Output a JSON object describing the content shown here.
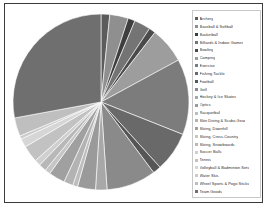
{
  "chart_data": {
    "type": "pie",
    "title": "",
    "legend_position": "right",
    "start_angle_deg": 0,
    "direction": "clockwise",
    "categories": [
      "Archery",
      "Baseball & Softball",
      "Basketball",
      "Billiards & Indoor Games",
      "Bowling",
      "Camping",
      "Exercise",
      "Fishing Tackle",
      "Football",
      "Golf",
      "Hockey & Ice Skates",
      "Optics",
      "Racquetball",
      "Skin Diving & Scuba Gear",
      "Skiing, Downhill",
      "Skiing, Cross-Country",
      "Skiing, Snowboards",
      "Soccer Balls",
      "Tennis",
      "Volleyball & Badminton Sets",
      "Water Skis",
      "Wheel Sports & Pogo Sticks",
      "Team Goods"
    ],
    "values": [
      1.6,
      3.4,
      1.3,
      3.0,
      1.2,
      6.6,
      13.9,
      7.3,
      1.5,
      9.1,
      2.1,
      3.3,
      0.9,
      1.7,
      3.0,
      1.0,
      1.4,
      1.1,
      3.1,
      1.6,
      0.6,
      3.4,
      27.9
    ],
    "colors": [
      "#5c5c5c",
      "#8f8f8f",
      "#3e3e3e",
      "#747474",
      "#4a4a4a",
      "#9d9d9d",
      "#7c7c7c",
      "#696969",
      "#565656",
      "#8a8a8a",
      "#a8a8a8",
      "#9a9a9a",
      "#bdbdbd",
      "#b3b3b3",
      "#a0a0a0",
      "#c6c6c6",
      "#b8b8b8",
      "#cfcfcf",
      "#c2c2c2",
      "#d6d6d6",
      "#cbcbcb",
      "#bfbfbf",
      "#6f6f6f"
    ],
    "grid": false,
    "data_labels_shown": false
  },
  "legend": {
    "items": [
      {
        "label": "Archery",
        "color": "#5c5c5c"
      },
      {
        "label": "Baseball & Softball",
        "color": "#8f8f8f"
      },
      {
        "label": "Basketball",
        "color": "#3e3e3e"
      },
      {
        "label": "Billiards & Indoor Games",
        "color": "#747474"
      },
      {
        "label": "Bowling",
        "color": "#4a4a4a"
      },
      {
        "label": "Camping",
        "color": "#9d9d9d"
      },
      {
        "label": "Exercise",
        "color": "#7c7c7c"
      },
      {
        "label": "Fishing Tackle",
        "color": "#696969"
      },
      {
        "label": "Football",
        "color": "#565656"
      },
      {
        "label": "Golf",
        "color": "#8a8a8a"
      },
      {
        "label": "Hockey & Ice Skates",
        "color": "#a8a8a8"
      },
      {
        "label": "Optics",
        "color": "#9a9a9a"
      },
      {
        "label": "Racquetball",
        "color": "#bdbdbd"
      },
      {
        "label": "Skin Diving & Scuba Gear",
        "color": "#b3b3b3"
      },
      {
        "label": "Skiing, Downhill",
        "color": "#a0a0a0"
      },
      {
        "label": "Skiing, Cross-Country",
        "color": "#c6c6c6"
      },
      {
        "label": "Skiing, Snowboards",
        "color": "#b8b8b8"
      },
      {
        "label": "Soccer Balls",
        "color": "#cfcfcf"
      },
      {
        "label": "Tennis",
        "color": "#c2c2c2"
      },
      {
        "label": "Volleyball & Badminton Sets",
        "color": "#d6d6d6"
      },
      {
        "label": "Water Skis",
        "color": "#cbcbcb"
      },
      {
        "label": "Wheel Sports & Pogo Sticks",
        "color": "#bfbfbf"
      },
      {
        "label": "Team Goods",
        "color": "#6f6f6f"
      }
    ]
  }
}
